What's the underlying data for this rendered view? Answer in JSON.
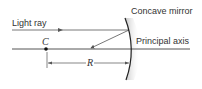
{
  "labels": {
    "mirror": "Concave mirror",
    "light_ray": "Light ray",
    "axis": "Principal axis",
    "center": "C",
    "radius": "R"
  },
  "colors": {
    "line": "#555555",
    "mirror": "#222222",
    "text": "#333333"
  }
}
